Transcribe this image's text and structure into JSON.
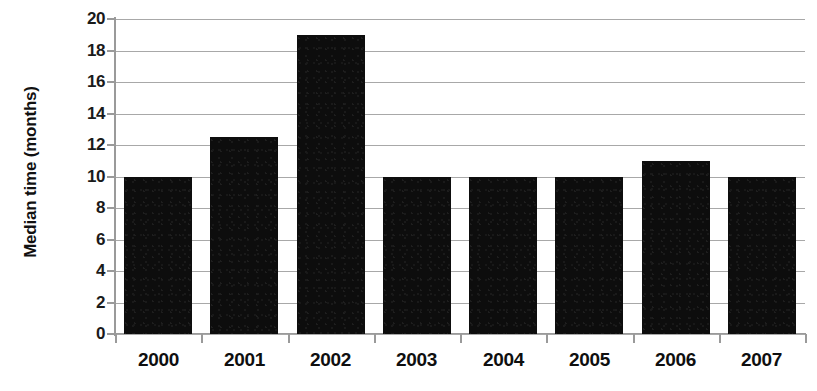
{
  "chart_data": {
    "type": "bar",
    "title": "",
    "xlabel": "",
    "ylabel": "Median time (months)",
    "categories": [
      "2000",
      "2001",
      "2002",
      "2003",
      "2004",
      "2005",
      "2006",
      "2007"
    ],
    "values": [
      10,
      12.5,
      19,
      10,
      10,
      10,
      11,
      10
    ],
    "series": [
      {
        "name": "Median time",
        "values": [
          10,
          12.5,
          19,
          10,
          10,
          10,
          11,
          10
        ]
      }
    ],
    "ylim": [
      0,
      20
    ],
    "ytick_labels": [
      "0",
      "2",
      "4",
      "6",
      "8",
      "10",
      "12",
      "14",
      "16",
      "18",
      "20"
    ],
    "ytick_values": [
      0,
      2,
      4,
      6,
      8,
      10,
      12,
      14,
      16,
      18,
      20
    ],
    "grid": true,
    "grid_axis": "y",
    "legend": false,
    "legend_position": "none",
    "bar_color": "#0d0d0d",
    "gridline_color": "#a8a8a8",
    "axis_color": "#9a9a9a",
    "label_color": "#111111",
    "background_color": "#ffffff"
  }
}
